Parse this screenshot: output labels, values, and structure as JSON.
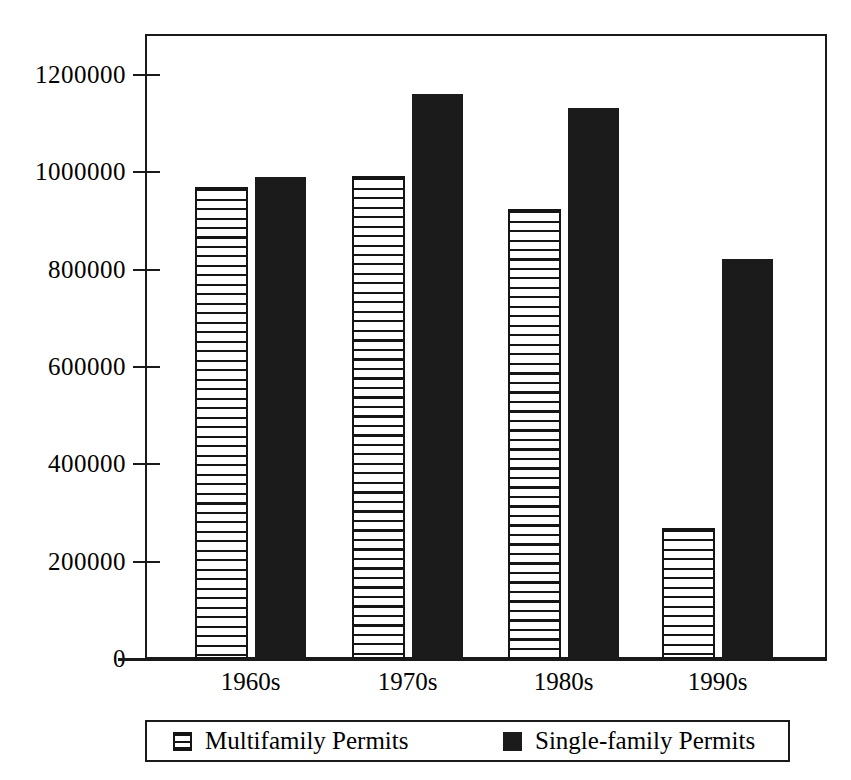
{
  "chart_data": {
    "type": "bar",
    "title": "",
    "subtitle": "",
    "xlabel": "",
    "ylabel": "",
    "categories": [
      "1960s",
      "1970s",
      "1980s",
      "1990s"
    ],
    "series": [
      {
        "name": "Multifamily Permits",
        "fill": "horizontal-stripes",
        "color": "#151515",
        "values": [
          970000,
          993000,
          925000,
          270000
        ]
      },
      {
        "name": "Single-family Permits",
        "fill": "solid",
        "color": "#1b1b1b",
        "values": [
          990000,
          1162000,
          1132000,
          822000
        ]
      }
    ],
    "ylim": [
      0,
      1200000
    ],
    "ytick_values": [
      0,
      200000,
      400000,
      600000,
      800000,
      1000000,
      1200000
    ],
    "ytick_labels": [
      "0",
      "200000",
      "400000",
      "600000",
      "800000",
      "1000000",
      "1200000"
    ],
    "grid": false,
    "legend_position": "bottom",
    "legend_entries": [
      {
        "label": "Multifamily Permits",
        "swatch": "striped-square-icon"
      },
      {
        "label": "Single-family Permits",
        "swatch": "solid-black-square-icon"
      }
    ],
    "background_color": "#ffffff",
    "frame_color": "#1a1a1a"
  }
}
